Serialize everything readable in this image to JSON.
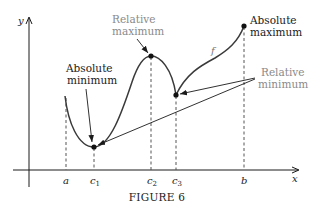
{
  "figure": {
    "caption": "FIGURE 6",
    "axes": {
      "x_label": "x",
      "y_label": "y"
    },
    "function_label": "f",
    "ticks": {
      "a": "a",
      "c1_base": "c",
      "c1_sub": "1",
      "c2_base": "c",
      "c2_sub": "2",
      "c3_base": "c",
      "c3_sub": "3",
      "b": "b"
    },
    "annotations": {
      "absolute_minimum": {
        "line1": "Absolute",
        "line2": "minimum"
      },
      "relative_maximum": {
        "line1": "Relative",
        "line2": "maximum"
      },
      "absolute_maximum": {
        "line1": "Absolute",
        "line2": "maximum"
      },
      "relative_minimum": {
        "line1": "Relative",
        "line2": "minimum"
      }
    },
    "colors": {
      "curve": "#3a3a3a",
      "axis": "#1a1a1a",
      "dashed_guide": "#555555",
      "annotation_dark": "#1a1a1a",
      "annotation_gray": "#8a8a8a"
    },
    "points": [
      {
        "name": "absolute minimum",
        "at": "c1"
      },
      {
        "name": "relative maximum",
        "at": "c2"
      },
      {
        "name": "relative minimum",
        "at": "c3"
      },
      {
        "name": "absolute maximum",
        "at": "b"
      }
    ]
  }
}
